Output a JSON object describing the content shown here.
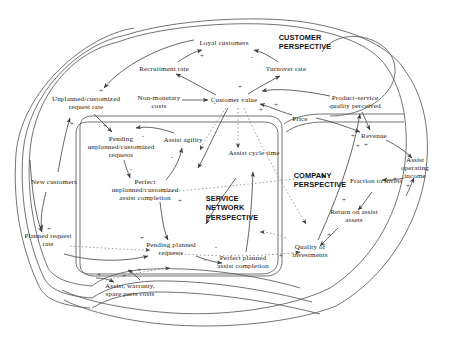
{
  "diagram": {
    "type": "causal-loop-diagram",
    "title": "",
    "background_color": "#ffffff",
    "line_color": "#4a4a4a",
    "text_color": "#1c1c1c",
    "perspectives": [
      {
        "id": "customer",
        "label": "CUSTOMER\nPERSPECTIVE",
        "x": 305,
        "y": 42
      },
      {
        "id": "service-network",
        "label": "SERVICE\nNETWORK\nPERSPECTIVE",
        "x": 232,
        "y": 208
      },
      {
        "id": "company",
        "label": "COMPANY\nPERSPECTIVE",
        "x": 320,
        "y": 180
      }
    ],
    "nodes": [
      {
        "id": "loyal-customers",
        "label": "Loyal customers",
        "x": 224,
        "y": 43
      },
      {
        "id": "turnover-rate",
        "label": "Turnover rate",
        "x": 286,
        "y": 69
      },
      {
        "id": "recruitment-rate",
        "label": "Recruitment rate",
        "x": 164,
        "y": 69
      },
      {
        "id": "unplanned-customized-request-rate",
        "label": "Unplanned/customized\nrequest rate",
        "x": 86,
        "y": 103
      },
      {
        "id": "non-monetary-costs",
        "label": "Non-monetary\ncosts",
        "x": 159,
        "y": 102
      },
      {
        "id": "customer-value",
        "label": "Customer value",
        "x": 234,
        "y": 100
      },
      {
        "id": "product-service-quality-perceived",
        "label": "Product-service\nquality perceived",
        "x": 355,
        "y": 102
      },
      {
        "id": "price",
        "label": "Price",
        "x": 300,
        "y": 119
      },
      {
        "id": "revenue",
        "label": "Revenue",
        "x": 374,
        "y": 136
      },
      {
        "id": "pending-unplanned-customized-requests",
        "label": "Pending\nunplanned/customized\nrequests",
        "x": 121,
        "y": 147
      },
      {
        "id": "assist-agility",
        "label": "Assist agility",
        "x": 183,
        "y": 140
      },
      {
        "id": "assist-cycle-time",
        "label": "Assist cycle time",
        "x": 254,
        "y": 153
      },
      {
        "id": "assist-operating-income",
        "label": "Assist operating\nincome",
        "x": 415,
        "y": 168
      },
      {
        "id": "fraction-to-invest",
        "label": "Fraction to invest",
        "x": 376,
        "y": 181
      },
      {
        "id": "perfect-unplanned-customized-assist-completion",
        "label": "Perfect\nunplanned/customized\nassist completion",
        "x": 145,
        "y": 190
      },
      {
        "id": "new-customers",
        "label": "New customers",
        "x": 54,
        "y": 182
      },
      {
        "id": "return-on-assist-assets",
        "label": "Return on assist\nassets",
        "x": 354,
        "y": 216
      },
      {
        "id": "quality-of-investments",
        "label": "Quality of\ninvestments",
        "x": 310,
        "y": 251
      },
      {
        "id": "planned-request-rate",
        "label": "Planned request\nrate",
        "x": 48,
        "y": 240
      },
      {
        "id": "pending-planned-requests",
        "label": "Pending planned\nrequests",
        "x": 171,
        "y": 249
      },
      {
        "id": "perfect-planned-assist-completion",
        "label": "Perfect planned\nassist completion",
        "x": 243,
        "y": 262
      },
      {
        "id": "assist-warranty-spare-parts-costs",
        "label": "Assist, warranty,\nspare parts costs",
        "x": 130,
        "y": 290
      }
    ],
    "polarity_marks": [
      {
        "sign": "+",
        "x": 202,
        "y": 56
      },
      {
        "sign": "-",
        "x": 252,
        "y": 57
      },
      {
        "sign": "+",
        "x": 101,
        "y": 91
      },
      {
        "sign": "+",
        "x": 240,
        "y": 87
      },
      {
        "sign": "+",
        "x": 276,
        "y": 105
      },
      {
        "sign": "-",
        "x": 215,
        "y": 103
      },
      {
        "sign": "+",
        "x": 261,
        "y": 110
      },
      {
        "sign": "+",
        "x": 353,
        "y": 136
      },
      {
        "sign": "+",
        "x": 358,
        "y": 146
      },
      {
        "sign": "+",
        "x": 366,
        "y": 145
      },
      {
        "sign": "+",
        "x": 72,
        "y": 124
      },
      {
        "sign": "+",
        "x": 105,
        "y": 126
      },
      {
        "sign": "-",
        "x": 143,
        "y": 136
      },
      {
        "sign": "-",
        "x": 172,
        "y": 157
      },
      {
        "sign": "-",
        "x": 131,
        "y": 169
      },
      {
        "sign": "+",
        "x": 395,
        "y": 179
      },
      {
        "sign": "+",
        "x": 408,
        "y": 186
      },
      {
        "sign": "+",
        "x": 344,
        "y": 200
      },
      {
        "sign": "+",
        "x": 180,
        "y": 201
      },
      {
        "sign": "+",
        "x": 329,
        "y": 235
      },
      {
        "sign": "+",
        "x": 49,
        "y": 229
      },
      {
        "sign": "+",
        "x": 142,
        "y": 238
      },
      {
        "sign": "+",
        "x": 281,
        "y": 256
      },
      {
        "sign": "-",
        "x": 205,
        "y": 260
      },
      {
        "sign": "+",
        "x": 139,
        "y": 270
      },
      {
        "sign": "+",
        "x": 99,
        "y": 275
      },
      {
        "sign": "+",
        "x": 124,
        "y": 276
      },
      {
        "sign": "-",
        "x": 216,
        "y": 247
      }
    ]
  }
}
